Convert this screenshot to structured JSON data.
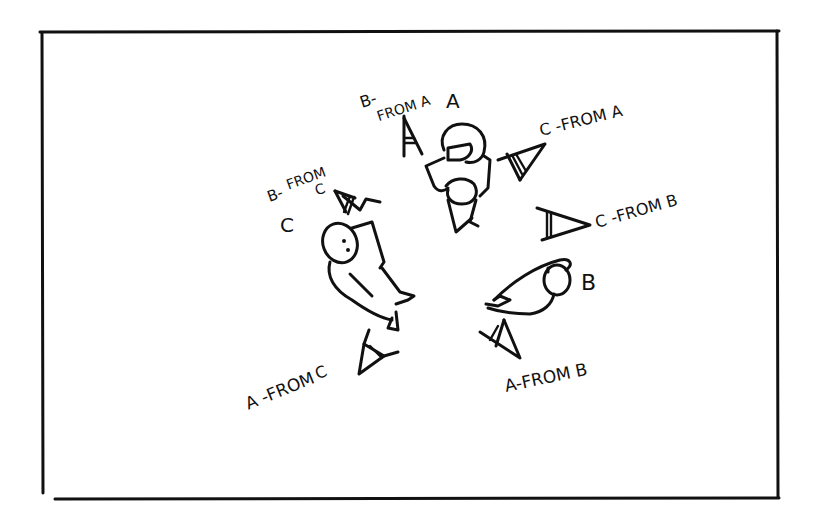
{
  "diagram": {
    "type": "hand-drawn camera-angle sketch",
    "ink_color": "#111111",
    "background": "#ffffff",
    "characters": [
      {
        "id": "A",
        "label": "A"
      },
      {
        "id": "B",
        "label": "B"
      },
      {
        "id": "C",
        "label": "C"
      }
    ],
    "camera_labels": {
      "b_from_a_line1": "B-",
      "b_from_a_line2": "FROM A",
      "c_from_a": "C -FROM A",
      "b_from_c_line1": "B-",
      "b_from_c_line2": "FROM",
      "b_from_c_line3": "C",
      "c_from_b": "C -FROM B",
      "a_from_c_line1": "A -FROM",
      "a_from_c_line2": "C",
      "a_from_b": "A-FROM B"
    },
    "cameras": [
      {
        "name": "B from A"
      },
      {
        "name": "C from A"
      },
      {
        "name": "B from C"
      },
      {
        "name": "C from B"
      },
      {
        "name": "A from C"
      },
      {
        "name": "A from B"
      }
    ]
  }
}
